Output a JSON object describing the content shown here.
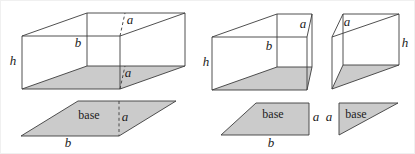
{
  "figure": {
    "width": 415,
    "height": 154,
    "colors": {
      "background": "#ffffff",
      "line": "#3c3c3c",
      "shape_fill": "#cbcbcb",
      "text": "#222222"
    },
    "shapes": [
      {
        "name": "left-box-bottom-face",
        "type": "polygon",
        "points": "21,88 119,88 184,65 86,65",
        "fill": true,
        "stroke": false
      },
      {
        "name": "left-base-parallelogram",
        "type": "polygon",
        "points": "20,135 118,135 175,100 77,100",
        "fill": true,
        "stroke": true
      },
      {
        "name": "middle-box-bottom-face",
        "type": "polygon",
        "points": "211,89 306,89 311,66 276,66",
        "fill": true,
        "stroke": false
      },
      {
        "name": "small-prism-bottom-face",
        "type": "polygon",
        "points": "331,88 342,64 398,64",
        "fill": true,
        "stroke": false
      },
      {
        "name": "right-trapezoid-base",
        "type": "polygon",
        "points": "220,134 308,134 308,102 255,102",
        "fill": true,
        "stroke": true
      },
      {
        "name": "right-triangle-base",
        "type": "polygon",
        "points": "338,102 397,102 338,134",
        "fill": true,
        "stroke": true
      },
      {
        "name": "left-box-edges",
        "type": "path",
        "d": "M21,35 H119 V88 H21 Z M86,12 H184 V65 H86 Z M21,35 L86,12 M119,35 L184,12 M21,88 L86,65 M119,88 L184,65",
        "fill": false,
        "stroke": true
      },
      {
        "name": "middle-box-edges",
        "type": "path",
        "d": "M211,36 H306 V89 H211 Z M276,13 H311 V66 H276 Z M211,36 L276,13 M306,36 L311,13 M211,89 L276,66 M306,89 L311,66",
        "fill": false,
        "stroke": true
      },
      {
        "name": "small-prism-edges",
        "type": "path",
        "d": "M331,36 L331,88 M331,36 L342,13 L398,13 Z M398,13 L398,64 M342,13 L342,64 M331,88 L342,64 L398,64 Z",
        "fill": false,
        "stroke": true
      },
      {
        "name": "left-box-height-a-dash-top",
        "type": "path",
        "d": "M119,35 L124,12",
        "fill": false,
        "stroke": true,
        "dashed": true
      },
      {
        "name": "left-box-height-a-dash-bottom",
        "type": "path",
        "d": "M119,88 L124,65",
        "fill": false,
        "stroke": true,
        "dashed": true
      },
      {
        "name": "left-base-height-a-dash",
        "type": "path",
        "d": "M118,100 L118,135",
        "fill": false,
        "stroke": true,
        "dashed": true
      }
    ],
    "labels": [
      {
        "name": "left-box-label-h",
        "text": "h",
        "x": 12,
        "y": 64,
        "kind": "math"
      },
      {
        "name": "left-box-label-b",
        "text": "b",
        "x": 77,
        "y": 46,
        "kind": "math"
      },
      {
        "name": "left-box-label-a-top",
        "text": "a",
        "x": 129,
        "y": 23,
        "kind": "math"
      },
      {
        "name": "left-box-label-a-bottom",
        "text": "a",
        "x": 127,
        "y": 76,
        "kind": "math"
      },
      {
        "name": "left-base-label-base",
        "text": "base",
        "x": 88,
        "y": 118,
        "kind": "word"
      },
      {
        "name": "left-base-label-a",
        "text": "a",
        "x": 124,
        "y": 120,
        "kind": "math"
      },
      {
        "name": "left-base-label-b",
        "text": "b",
        "x": 67,
        "y": 146,
        "kind": "math"
      },
      {
        "name": "middle-box-label-h",
        "text": "h",
        "x": 205,
        "y": 65,
        "kind": "math"
      },
      {
        "name": "middle-box-label-b",
        "text": "b",
        "x": 268,
        "y": 49,
        "kind": "math"
      },
      {
        "name": "middle-box-label-a",
        "text": "a",
        "x": 302,
        "y": 27,
        "kind": "math"
      },
      {
        "name": "small-prism-label-a",
        "text": "a",
        "x": 346,
        "y": 25,
        "kind": "math"
      },
      {
        "name": "small-prism-label-h",
        "text": "h",
        "x": 404,
        "y": 46,
        "kind": "math"
      },
      {
        "name": "right-trapezoid-label-base",
        "text": "base",
        "x": 272,
        "y": 117,
        "kind": "word"
      },
      {
        "name": "right-trapezoid-label-a",
        "text": "a",
        "x": 315,
        "y": 120,
        "kind": "math"
      },
      {
        "name": "right-trapezoid-label-b",
        "text": "b",
        "x": 270,
        "y": 146,
        "kind": "math"
      },
      {
        "name": "right-triangle-label-a",
        "text": "a",
        "x": 328,
        "y": 120,
        "kind": "math"
      },
      {
        "name": "right-triangle-label-base",
        "text": "base",
        "x": 355,
        "y": 117,
        "kind": "word"
      }
    ]
  }
}
